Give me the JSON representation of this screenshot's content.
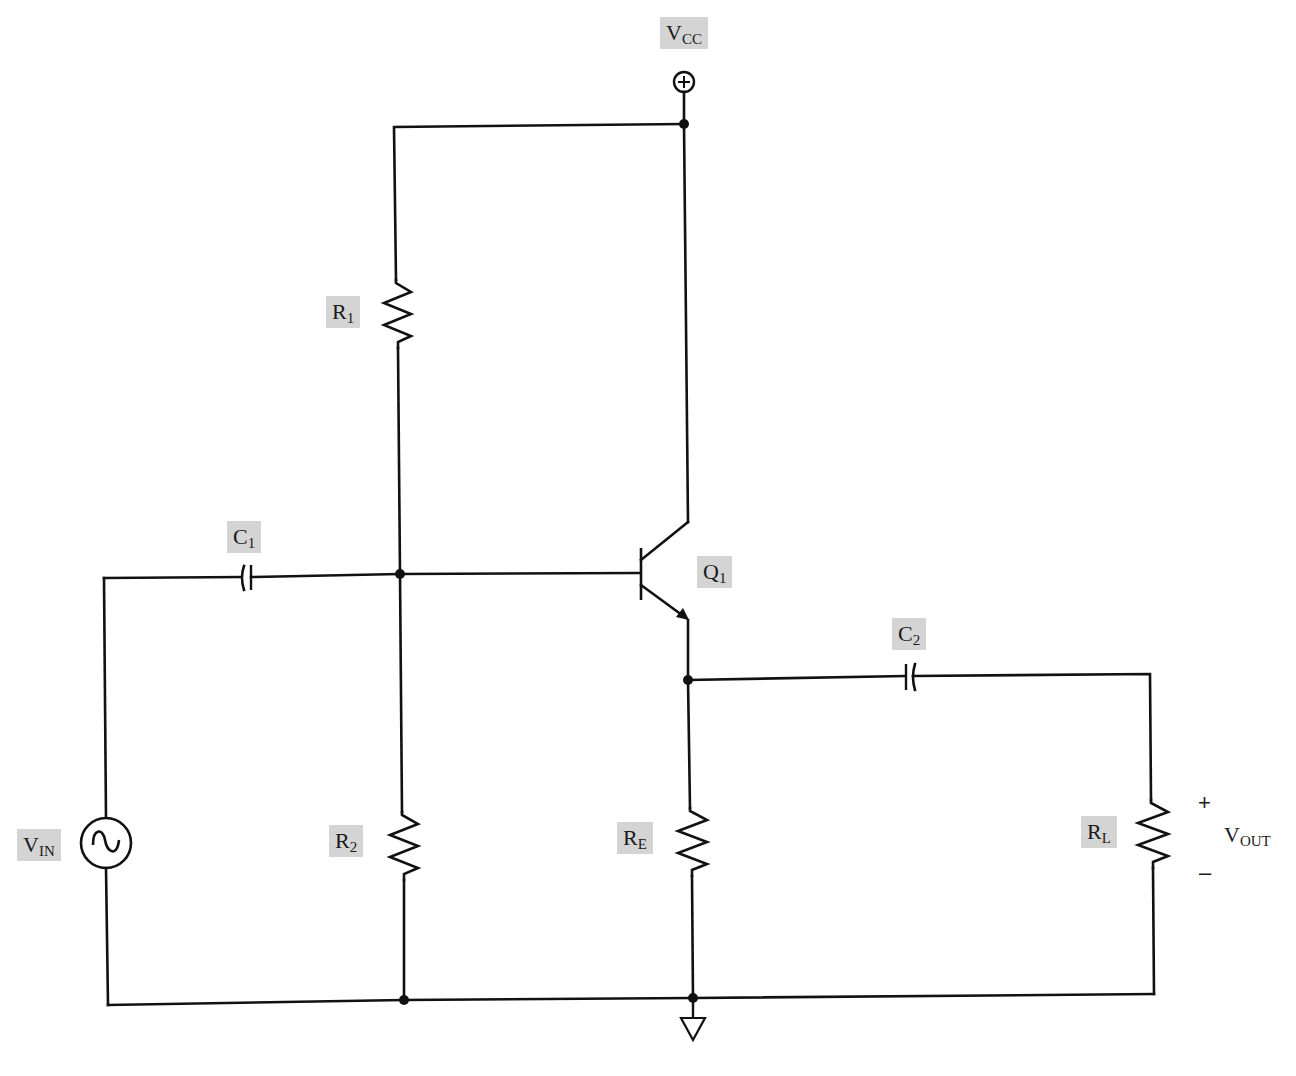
{
  "diagram": {
    "colors": {
      "wire": "#111111",
      "label_bg": "#d4d4d4",
      "background": "#ffffff"
    },
    "supply": {
      "main": "V",
      "sub": "CC",
      "symbol": "+"
    },
    "components": {
      "R1": {
        "main": "R",
        "sub": "1",
        "type": "resistor"
      },
      "R2": {
        "main": "R",
        "sub": "2",
        "type": "resistor"
      },
      "RE": {
        "main": "R",
        "sub": "E",
        "type": "resistor"
      },
      "RL": {
        "main": "R",
        "sub": "L",
        "type": "resistor"
      },
      "C1": {
        "main": "C",
        "sub": "1",
        "type": "capacitor"
      },
      "C2": {
        "main": "C",
        "sub": "2",
        "type": "capacitor"
      },
      "Q1": {
        "main": "Q",
        "sub": "1",
        "type": "npn-transistor"
      },
      "VIN": {
        "main": "V",
        "sub": "IN",
        "type": "ac-source"
      }
    },
    "output": {
      "main": "V",
      "sub": "OUT",
      "plus": "+",
      "minus": "–"
    },
    "ground": {
      "type": "ground-symbol"
    }
  }
}
